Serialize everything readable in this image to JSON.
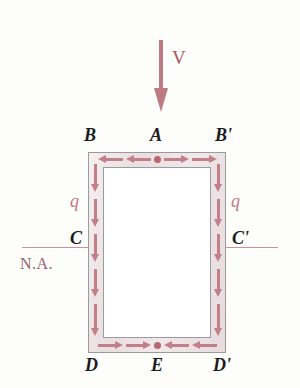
{
  "figure": {
    "load_label": "V",
    "neutral_axis_label": "N.A.",
    "shear_flow_label_left": "q",
    "shear_flow_label_right": "q",
    "corner_labels": {
      "top_left": "B",
      "top_center": "A",
      "top_right": "B'",
      "mid_left": "C",
      "mid_right": "C'",
      "bottom_left": "D",
      "bottom_center": "E",
      "bottom_right": "D'"
    },
    "colors": {
      "accent": "#c27f87",
      "load_arrow": "#bd7a80",
      "neutral_axis_line": "#cf9199",
      "wall_fill": "#e8dde0",
      "outline": "#9b9a9c",
      "label_text": "#1b1b1b",
      "na_text": "#9c6067",
      "flow_dot": "#b9666f"
    },
    "flow_arrows": {
      "top_wall_direction": "outward-from-center",
      "bottom_wall_direction": "inward-to-center",
      "left_wall_direction": "down",
      "right_wall_direction": "down",
      "top_wall_count": 4,
      "bottom_wall_count": 4,
      "left_wall_count": 5,
      "right_wall_count": 5
    }
  }
}
